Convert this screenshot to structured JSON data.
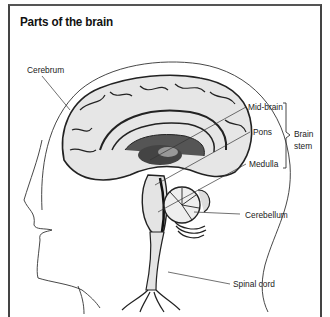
{
  "title": "Parts of the brain",
  "labels": {
    "cerebrum": "Cerebrum",
    "midbrain": "Mid-brain",
    "pons": "Pons",
    "medulla": "Medulla",
    "brain_stem_line1": "Brain",
    "brain_stem_line2": "stem",
    "cerebellum": "Cerebellum",
    "spinal_cord": "Spinal cord"
  },
  "colors": {
    "ink": "#222222",
    "brain_fill": "#e4e4e4",
    "shade": "#555555",
    "background": "#ffffff"
  }
}
